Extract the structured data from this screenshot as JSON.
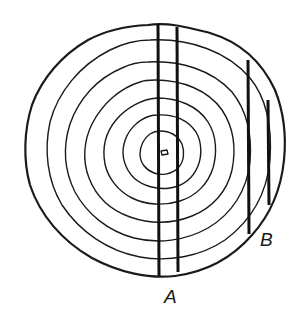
{
  "diagram": {
    "colors": {
      "ink": "#1a1a1a",
      "background": "#ffffff"
    },
    "rings_count": 7,
    "center": {
      "x": 165,
      "y": 154
    },
    "cuts": [
      {
        "id": "A",
        "label": "A",
        "lines": [
          {
            "x": 158,
            "y1": 24,
            "y2": 276
          },
          {
            "x": 177,
            "y1": 27,
            "y2": 272
          }
        ]
      },
      {
        "id": "B",
        "label": "B",
        "lines": [
          {
            "x": 248,
            "y1": 60,
            "y2": 234
          },
          {
            "x": 268,
            "y1": 100,
            "y2": 205
          }
        ]
      }
    ],
    "labels": {
      "a": "A",
      "b": "B"
    }
  }
}
